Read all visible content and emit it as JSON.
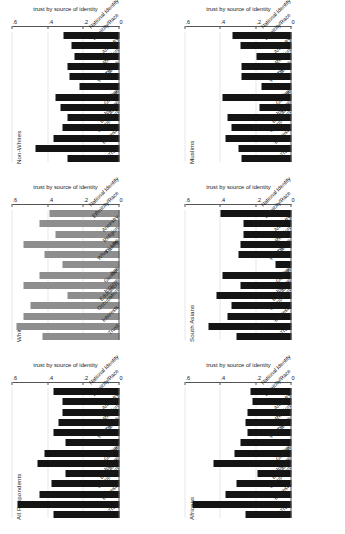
{
  "figure": {
    "background": "#ffffff",
    "bar_color_default": "#141414",
    "bar_color_whites": "#8e8e8e",
    "gridline_color": "#e8e8e8",
    "axis_color": "#555555",
    "rotation_note": "figure rendered rotated 90 degrees counter-clockwise"
  },
  "chart_data": {
    "type": "bar",
    "title": "",
    "subtitle": "",
    "xlabel": "",
    "ylabel": "trust by source of identity",
    "ylim": [
      0,
      0.6
    ],
    "ytick_labels": [
      "0",
      ".2",
      ".4",
      ".6"
    ],
    "ytick_values": [
      0,
      0.2,
      0.4,
      0.6
    ],
    "grid": true,
    "legend": "none",
    "legend_position": "none",
    "categories": [
      "Trust",
      "Interests",
      "Occupation",
      "Education",
      "Income",
      "Gender",
      "Age",
      "Where Live",
      "Family",
      "Religion",
      "Ancestry",
      "Ethnicity/Race",
      "National Identity"
    ],
    "panel_layout": {
      "rows": 2,
      "cols": 3,
      "order": [
        "All Respondents",
        "Whites",
        "Non-Whites",
        "Africans",
        "South Asians",
        "Muslims"
      ]
    },
    "panels": [
      {
        "name": "All Respondents",
        "color": "#141414",
        "values": [
          0.37,
          0.57,
          0.45,
          0.38,
          0.3,
          0.46,
          0.42,
          0.3,
          0.37,
          0.34,
          0.32,
          0.32,
          0.37
        ]
      },
      {
        "name": "Whites",
        "color": "#8e8e8e",
        "values": [
          0.43,
          0.58,
          0.54,
          0.5,
          0.29,
          0.54,
          0.45,
          0.32,
          0.42,
          0.54,
          0.36,
          0.45,
          0.39
        ]
      },
      {
        "name": "Non-Whites",
        "color": "#141414",
        "values": [
          0.29,
          0.47,
          0.37,
          0.32,
          0.29,
          0.33,
          0.36,
          0.22,
          0.28,
          0.29,
          0.25,
          0.27,
          0.31
        ]
      },
      {
        "name": "Africans",
        "color": "#141414",
        "values": [
          0.26,
          0.56,
          0.37,
          0.31,
          0.19,
          0.44,
          0.32,
          0.29,
          0.25,
          0.26,
          0.25,
          0.22,
          0.23
        ]
      },
      {
        "name": "South Asians",
        "color": "#141414",
        "values": [
          0.31,
          0.47,
          0.36,
          0.34,
          0.42,
          0.29,
          0.39,
          0.09,
          0.3,
          0.29,
          0.27,
          0.27,
          0.4
        ]
      },
      {
        "name": "Muslims",
        "color": "#141414",
        "values": [
          0.28,
          0.3,
          0.37,
          0.34,
          0.36,
          0.18,
          0.39,
          0.17,
          0.28,
          0.28,
          0.2,
          0.29,
          0.33
        ]
      }
    ]
  },
  "series_series_names": []
}
